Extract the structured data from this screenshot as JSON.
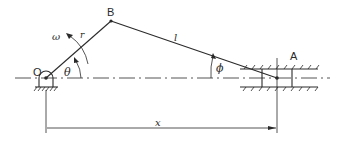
{
  "diagram": {
    "type": "slider-crank mechanism",
    "labels": {
      "pivot": "O",
      "crank_end": "B",
      "slider": "A",
      "angular_velocity": "ω",
      "crank_length": "r",
      "rod_length": "l",
      "crank_angle": "θ",
      "rod_angle": "ϕ",
      "displacement": "x"
    },
    "colors": {
      "line": "#2a2a2a",
      "background": "#ffffff"
    }
  }
}
